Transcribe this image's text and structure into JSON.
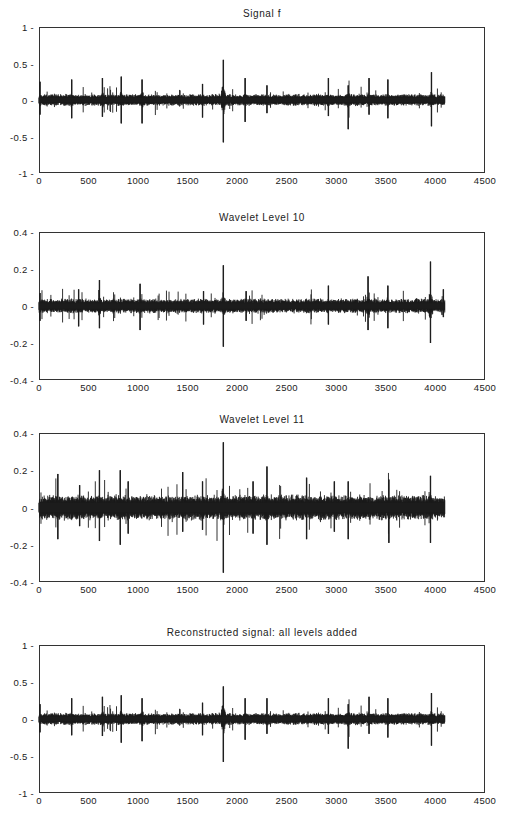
{
  "chart_data": [
    {
      "type": "line",
      "title": "Signal f",
      "xlabel": "",
      "ylabel": "",
      "xlim": [
        0,
        4500
      ],
      "ylim": [
        -1,
        1
      ],
      "x_ticks": [
        "0",
        "500",
        "1000",
        "1500",
        "2000",
        "2500",
        "3000",
        "3500",
        "4000",
        "4500"
      ],
      "y_ticks": [
        "1",
        "0.5",
        "0",
        "-0.5",
        "-1"
      ],
      "y_tick_values": [
        1,
        0.5,
        0,
        -0.5,
        -1
      ],
      "grid": false,
      "n_samples": 4096,
      "base_amplitude": 0.07,
      "seed": 11,
      "spikes": [
        {
          "x": 10,
          "up": 0.25,
          "down": -0.2
        },
        {
          "x": 330,
          "up": 0.28,
          "down": -0.25
        },
        {
          "x": 640,
          "up": 0.3,
          "down": -0.23
        },
        {
          "x": 830,
          "up": 0.32,
          "down": -0.32
        },
        {
          "x": 1040,
          "up": 0.28,
          "down": -0.32
        },
        {
          "x": 1650,
          "up": 0.22,
          "down": -0.24
        },
        {
          "x": 1860,
          "up": 0.55,
          "down": -0.58
        },
        {
          "x": 2080,
          "up": 0.3,
          "down": -0.3
        },
        {
          "x": 2300,
          "up": 0.2,
          "down": -0.18
        },
        {
          "x": 2920,
          "up": 0.3,
          "down": -0.22
        },
        {
          "x": 3120,
          "up": 0.2,
          "down": -0.4
        },
        {
          "x": 3330,
          "up": 0.3,
          "down": -0.2
        },
        {
          "x": 3520,
          "up": 0.28,
          "down": -0.25
        },
        {
          "x": 3960,
          "up": 0.38,
          "down": -0.36
        }
      ]
    },
    {
      "type": "line",
      "title": "Wavelet Level 10",
      "xlabel": "",
      "ylabel": "",
      "xlim": [
        0,
        4500
      ],
      "ylim": [
        -0.4,
        0.4
      ],
      "x_ticks": [
        "0",
        "500",
        "1000",
        "1500",
        "2000",
        "2500",
        "3000",
        "3500",
        "4000",
        "4500"
      ],
      "y_ticks": [
        "0.4",
        "0.2",
        "0",
        "-0.2",
        "-0.4"
      ],
      "y_tick_values": [
        0.4,
        0.2,
        0,
        -0.2,
        -0.4
      ],
      "grid": false,
      "n_samples": 4096,
      "base_amplitude": 0.035,
      "seed": 23,
      "spikes": [
        {
          "x": 10,
          "up": 0.07,
          "down": -0.08
        },
        {
          "x": 400,
          "up": 0.09,
          "down": -0.11
        },
        {
          "x": 610,
          "up": 0.14,
          "down": -0.12
        },
        {
          "x": 1020,
          "up": 0.12,
          "down": -0.13
        },
        {
          "x": 1660,
          "up": 0.08,
          "down": -0.1
        },
        {
          "x": 1860,
          "up": 0.22,
          "down": -0.22
        },
        {
          "x": 2090,
          "up": 0.08,
          "down": -0.08
        },
        {
          "x": 2920,
          "up": 0.11,
          "down": -0.1
        },
        {
          "x": 3320,
          "up": 0.16,
          "down": -0.13
        },
        {
          "x": 3520,
          "up": 0.11,
          "down": -0.12
        },
        {
          "x": 3950,
          "up": 0.24,
          "down": -0.2
        },
        {
          "x": 4080,
          "up": 0.09,
          "down": -0.06
        }
      ]
    },
    {
      "type": "line",
      "title": "Wavelet Level 11",
      "xlabel": "",
      "ylabel": "",
      "xlim": [
        0,
        4500
      ],
      "ylim": [
        -0.4,
        0.4
      ],
      "x_ticks": [
        "0",
        "500",
        "1000",
        "1500",
        "2000",
        "2500",
        "3000",
        "3500",
        "4000",
        "4500"
      ],
      "y_ticks": [
        "0.4",
        "0.2",
        "0",
        "-0.2",
        "-0.4"
      ],
      "y_tick_values": [
        0.4,
        0.2,
        0,
        -0.2,
        -0.4
      ],
      "grid": false,
      "n_samples": 4096,
      "base_amplitude": 0.06,
      "seed": 37,
      "spikes": [
        {
          "x": 190,
          "up": 0.18,
          "down": -0.17
        },
        {
          "x": 410,
          "up": 0.12,
          "down": -0.1
        },
        {
          "x": 610,
          "up": 0.2,
          "down": -0.18
        },
        {
          "x": 820,
          "up": 0.2,
          "down": -0.2
        },
        {
          "x": 900,
          "up": 0.14,
          "down": -0.14
        },
        {
          "x": 1450,
          "up": 0.19,
          "down": -0.13
        },
        {
          "x": 1650,
          "up": 0.14,
          "down": -0.12
        },
        {
          "x": 1860,
          "up": 0.35,
          "down": -0.35
        },
        {
          "x": 2160,
          "up": 0.14,
          "down": -0.14
        },
        {
          "x": 2300,
          "up": 0.22,
          "down": -0.2
        },
        {
          "x": 2700,
          "up": 0.16,
          "down": -0.17
        },
        {
          "x": 2980,
          "up": 0.14,
          "down": -0.13
        },
        {
          "x": 3120,
          "up": 0.14,
          "down": -0.17
        },
        {
          "x": 3530,
          "up": 0.15,
          "down": -0.19
        },
        {
          "x": 3950,
          "up": 0.17,
          "down": -0.19
        }
      ]
    },
    {
      "type": "line",
      "title": "Reconstructed signal: all levels added",
      "xlabel": "",
      "ylabel": "",
      "xlim": [
        0,
        4500
      ],
      "ylim": [
        -1,
        1
      ],
      "x_ticks": [
        "0",
        "500",
        "1000",
        "1500",
        "2000",
        "2500",
        "3000",
        "3500",
        "4000",
        "4500"
      ],
      "y_ticks": [
        "1",
        "0.5",
        "0",
        "-0.5",
        "-1"
      ],
      "y_tick_values": [
        1,
        0.5,
        0,
        -0.5,
        -1
      ],
      "grid": false,
      "n_samples": 4096,
      "base_amplitude": 0.07,
      "seed": 11,
      "spikes": [
        {
          "x": 10,
          "up": 0.2,
          "down": -0.18
        },
        {
          "x": 330,
          "up": 0.28,
          "down": -0.22
        },
        {
          "x": 640,
          "up": 0.3,
          "down": -0.23
        },
        {
          "x": 830,
          "up": 0.32,
          "down": -0.32
        },
        {
          "x": 1040,
          "up": 0.28,
          "down": -0.3
        },
        {
          "x": 1650,
          "up": 0.22,
          "down": -0.22
        },
        {
          "x": 1860,
          "up": 0.44,
          "down": -0.58
        },
        {
          "x": 2080,
          "up": 0.28,
          "down": -0.28
        },
        {
          "x": 2300,
          "up": 0.28,
          "down": -0.2
        },
        {
          "x": 2920,
          "up": 0.28,
          "down": -0.2
        },
        {
          "x": 3120,
          "up": 0.2,
          "down": -0.4
        },
        {
          "x": 3330,
          "up": 0.3,
          "down": -0.2
        },
        {
          "x": 3520,
          "up": 0.28,
          "down": -0.25
        },
        {
          "x": 3960,
          "up": 0.35,
          "down": -0.36
        }
      ]
    }
  ],
  "layout": {
    "panels": [
      {
        "title_top": 8,
        "axes_top": 27,
        "axes_bottom": 173
      },
      {
        "title_top": 212,
        "axes_top": 232,
        "axes_bottom": 380
      },
      {
        "title_top": 414,
        "axes_top": 433,
        "axes_bottom": 582
      },
      {
        "title_top": 627,
        "axes_top": 645,
        "axes_bottom": 793
      }
    ],
    "axes_left": 39,
    "axes_right": 485,
    "line_color": "#1c1c1c",
    "axis_color": "#333333"
  }
}
